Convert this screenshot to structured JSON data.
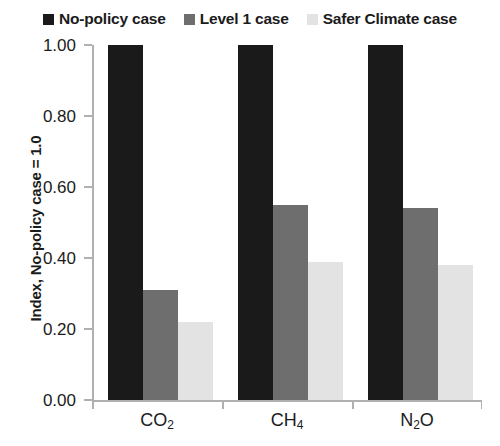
{
  "chart_data": {
    "type": "bar",
    "title": "",
    "subtitle": "",
    "xlabel": "",
    "ylabel": "Index, No-policy case = 1.0",
    "categories": [
      "CO₂",
      "CH₄",
      "N₂O"
    ],
    "categories_parts": [
      {
        "base": "CO",
        "sub": "2",
        "tail": ""
      },
      {
        "base": "CH",
        "sub": "4",
        "tail": ""
      },
      {
        "base": "N",
        "sub": "2",
        "tail": "O"
      }
    ],
    "series": [
      {
        "name": "No-policy case",
        "color": "#1a1a1a",
        "values": [
          1.0,
          1.0,
          1.0
        ]
      },
      {
        "name": "Level 1 case",
        "color": "#6e6e6e",
        "values": [
          0.31,
          0.55,
          0.54
        ]
      },
      {
        "name": "Safer Climate case",
        "color": "#e3e3e3",
        "values": [
          0.22,
          0.39,
          0.38
        ]
      }
    ],
    "ylim": [
      0.0,
      1.0
    ],
    "yticks": [
      0.0,
      0.2,
      0.4,
      0.6,
      0.8,
      1.0
    ],
    "ytick_labels": [
      "0.00",
      "0.20",
      "0.40",
      "0.60",
      "0.80",
      "1.00"
    ],
    "grid": false,
    "legend_position": "top-center",
    "axis_color": "#b0b0b0",
    "background": "#ffffff"
  },
  "legend": {
    "items": [
      {
        "label": "No-policy case",
        "color": "#1a1a1a"
      },
      {
        "label": "Level 1 case",
        "color": "#6e6e6e"
      },
      {
        "label": "Safer Climate case",
        "color": "#e3e3e3"
      }
    ]
  }
}
